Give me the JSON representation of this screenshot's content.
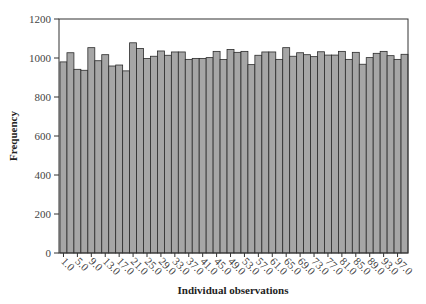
{
  "chart_data": {
    "type": "bar",
    "title": "",
    "xlabel": "Individual observations",
    "ylabel": "Frequency",
    "ylim": [
      0,
      1200
    ],
    "yticks": [
      0,
      200,
      400,
      600,
      800,
      1000,
      1200
    ],
    "xtick_labels": [
      "1.0",
      "5.0",
      "9.0",
      "13.0",
      "17.0",
      "21.0",
      "25.0",
      "29.0",
      "33.0",
      "37.0",
      "41.0",
      "45.0",
      "49.0",
      "53.0",
      "57.0",
      "61.0",
      "65.0",
      "69.0",
      "73.0",
      "77.0",
      "81.0",
      "85.0",
      "89.0",
      "93.0",
      "97.0"
    ],
    "grid": false,
    "legend": null,
    "categories": [
      1,
      3,
      5,
      7,
      9,
      11,
      13,
      15,
      17,
      19,
      21,
      23,
      25,
      27,
      29,
      31,
      33,
      35,
      37,
      39,
      41,
      43,
      45,
      47,
      49,
      51,
      53,
      55,
      57,
      59,
      61,
      63,
      65,
      67,
      69,
      71,
      73,
      75,
      77,
      79,
      81,
      83,
      85,
      87,
      89,
      91,
      93,
      95,
      97,
      99
    ],
    "values": [
      980,
      1027,
      942,
      937,
      1053,
      986,
      1017,
      959,
      964,
      934,
      1078,
      1049,
      997,
      1009,
      1036,
      1014,
      1031,
      1031,
      993,
      998,
      998,
      1002,
      1034,
      992,
      1044,
      1029,
      1034,
      966,
      1014,
      1031,
      1031,
      993,
      1053,
      1009,
      1027,
      1017,
      1007,
      1032,
      1015,
      1015,
      1034,
      993,
      1029,
      968,
      1002,
      1024,
      1034,
      1012,
      993,
      1019
    ],
    "colors": {
      "bar_fill": "#a6a6a6",
      "bar_edge": "#2b2b2b",
      "axis": "#333333"
    }
  }
}
